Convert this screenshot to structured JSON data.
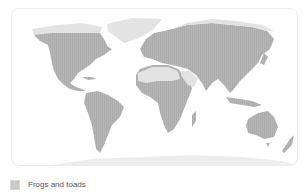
{
  "map": {
    "title": "",
    "colors": {
      "present": "#b5b5b5",
      "absent": "#e3e3e3",
      "ocean": "#ffffff",
      "border": "#ececec"
    }
  },
  "legend": {
    "items": [
      {
        "label": "Frogs and toads",
        "color": "#c8c8c8"
      }
    ]
  }
}
